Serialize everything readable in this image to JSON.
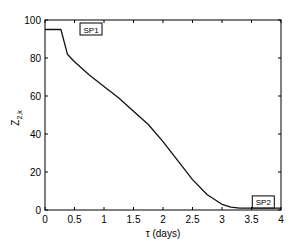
{
  "chart_data": {
    "type": "line",
    "title": "",
    "xlabel": "τ (days)",
    "ylabel": "Z",
    "ylabel_sub": "2,k",
    "xlim": [
      0,
      4
    ],
    "ylim": [
      0,
      100
    ],
    "grid": false,
    "x_ticks": [
      "0",
      "0.5",
      "1",
      "1.5",
      "2",
      "2.5",
      "3",
      "3.5",
      "4"
    ],
    "y_ticks": [
      "0",
      "20",
      "40",
      "60",
      "80",
      "100"
    ],
    "series": [
      {
        "name": "Z2,k",
        "x": [
          0,
          0.27,
          0.38,
          0.5,
          0.75,
          1.0,
          1.25,
          1.5,
          1.75,
          2.0,
          2.25,
          2.5,
          2.75,
          3.0,
          3.15,
          3.3,
          3.5,
          4.0
        ],
        "y": [
          95,
          95,
          82,
          78,
          71,
          65,
          59,
          52,
          45,
          36,
          26,
          16,
          8,
          3,
          1.5,
          1,
          1,
          1
        ]
      }
    ],
    "annotations": [
      {
        "text": "SP1",
        "x": 0.78,
        "y": 95
      },
      {
        "text": "SP2",
        "x": 3.7,
        "y": 4
      }
    ]
  }
}
